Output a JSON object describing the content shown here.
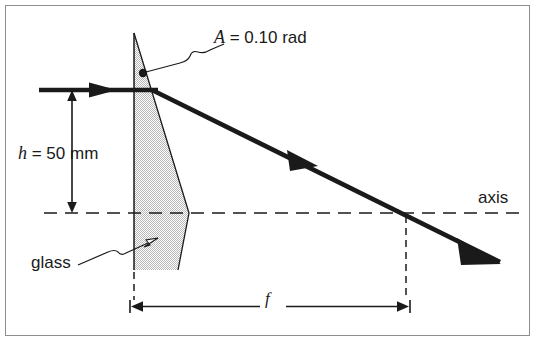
{
  "figure": {
    "background_color": "#ffffff",
    "frame_color": "#8d8d8d",
    "ink_color": "#1a1a1a",
    "glass_fill_color": "#d8d8d8",
    "glass_edge_color": "#1a1a1a"
  },
  "labels": {
    "angle": "A = 0.10 rad",
    "angle_symbol": "A",
    "angle_rest": " = 0.10 rad",
    "height": "h = 50 mm",
    "height_symbol": "h",
    "height_rest": " = 50 mm",
    "glass": "glass",
    "axis": "axis",
    "focal": "f"
  },
  "values": {
    "prism_angle_rad": 0.1,
    "ray_height_mm": 50,
    "focal_length_symbol": "f"
  },
  "elements": {
    "incoming_ray": "horizontal incident ray entering prism at height h",
    "refracted_ray": "deviated ray crossing the optical axis at focal point",
    "optical_axis": "horizontal dashed center line",
    "glass_wedge": "shaded thin prism of glass",
    "height_dimension": "double headed vertical dimension for h",
    "focal_dimension": "double headed horizontal dimension for f",
    "apex_dot": "marker dot at prism apex angle"
  }
}
